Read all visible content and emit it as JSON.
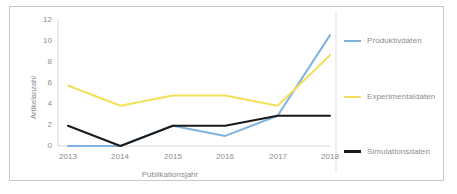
{
  "chart_data": {
    "type": "line",
    "title": "",
    "xlabel": "Publikationsjahr",
    "ylabel": "Artikelanzahl",
    "categories": [
      "2013",
      "2014",
      "2015",
      "2016",
      "2017",
      "2018"
    ],
    "yticks": [
      "0",
      "2",
      "4",
      "6",
      "8",
      "10",
      "12"
    ],
    "ylim": [
      0,
      12
    ],
    "grid": false,
    "legend_position": "right",
    "series": [
      {
        "name": "Produktivdaten",
        "color": "#7FB2DC",
        "values": [
          0,
          0,
          2,
          1,
          3,
          11
        ]
      },
      {
        "name": "Experimentaldaten",
        "color": "#F2E05C",
        "values": [
          6,
          4,
          5,
          5,
          4,
          9
        ]
      },
      {
        "name": "Simulationsdaten",
        "color": "#1A1A1A",
        "values": [
          2,
          0,
          2,
          2,
          3,
          3
        ]
      }
    ]
  },
  "ytick_labels": {
    "t0": "12",
    "t1": "10",
    "t2": "8",
    "t3": "6",
    "t4": "4",
    "t5": "2",
    "t6": "0"
  },
  "xtick_labels": {
    "t0": "2013",
    "t1": "2014",
    "t2": "2015",
    "t3": "2016",
    "t4": "2017",
    "t5": "2018"
  },
  "axis_titles": {
    "x": "Publikationsjahr",
    "y": "Artikelanzahl"
  },
  "legend": {
    "items": [
      {
        "label": "Produktivdaten",
        "color": "#7FB2DC"
      },
      {
        "label": "Experimentaldaten",
        "color": "#F2E05C"
      },
      {
        "label": "Simulationsdaten",
        "color": "#1A1A1A"
      }
    ]
  },
  "colors": {
    "frame_border": "#c8c8c8",
    "axis_line": "#d9d9d9",
    "tick_text": "#8c8c8c",
    "background": "#ffffff"
  }
}
